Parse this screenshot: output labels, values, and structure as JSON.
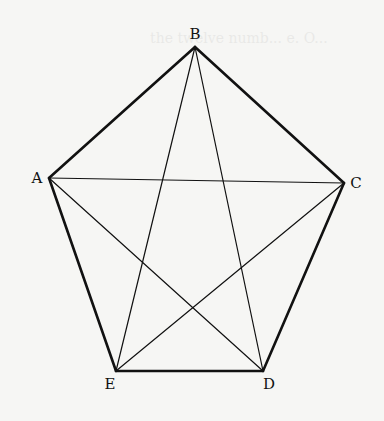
{
  "figure": {
    "type": "regular pentagon with inscribed pentagram (all diagonals drawn)",
    "background": "#f6f6f4",
    "stroke_color": "#111111",
    "vertices": [
      {
        "label": "A",
        "x": 49,
        "y": 178,
        "label_x": 37,
        "label_y": 183
      },
      {
        "label": "B",
        "x": 195,
        "y": 47,
        "label_x": 195,
        "label_y": 39
      },
      {
        "label": "C",
        "x": 344,
        "y": 183,
        "label_x": 356,
        "label_y": 188
      },
      {
        "label": "D",
        "x": 263,
        "y": 371,
        "label_x": 269,
        "label_y": 389
      },
      {
        "label": "E",
        "x": 116,
        "y": 371,
        "label_x": 110,
        "label_y": 389
      }
    ],
    "sides": [
      [
        "A",
        "B"
      ],
      [
        "B",
        "C"
      ],
      [
        "C",
        "D"
      ],
      [
        "D",
        "E"
      ],
      [
        "E",
        "A"
      ]
    ],
    "diagonals": [
      [
        "A",
        "C"
      ],
      [
        "A",
        "D"
      ],
      [
        "B",
        "D"
      ],
      [
        "B",
        "E"
      ],
      [
        "C",
        "E"
      ]
    ]
  },
  "bleed_text": "the twelve numb... e. O..."
}
